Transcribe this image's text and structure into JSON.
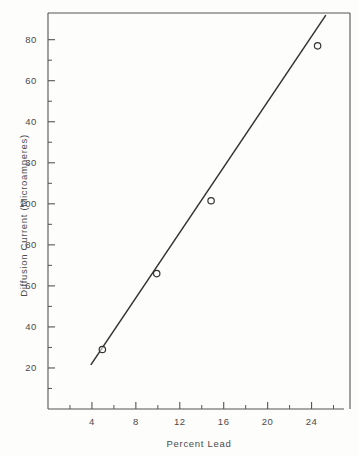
{
  "chart_data": {
    "type": "line",
    "title": "",
    "subtitle": "",
    "xlabel": "Percent  Lead",
    "ylabel": "Diffusion Current  (Microamperes)",
    "xlim": [
      0,
      27.5
    ],
    "ylim": [
      0,
      193
    ],
    "grid": false,
    "legend": null,
    "x_ticks": [
      {
        "value": 4,
        "label": "4"
      },
      {
        "value": 8,
        "label": "8"
      },
      {
        "value": 12,
        "label": "12"
      },
      {
        "value": 16,
        "label": "16"
      },
      {
        "value": 20,
        "label": "20"
      },
      {
        "value": 24,
        "label": "24"
      }
    ],
    "x_minor_ticks": [
      2,
      6,
      10,
      14,
      18,
      22,
      26
    ],
    "y_ticks": [
      {
        "value": 180,
        "label": "80"
      },
      {
        "value": 160,
        "label": "60"
      },
      {
        "value": 140,
        "label": "40"
      },
      {
        "value": 120,
        "label": "30"
      },
      {
        "value": 100,
        "label": "100"
      },
      {
        "value": 80,
        "label": "80"
      },
      {
        "value": 60,
        "label": "60"
      },
      {
        "value": 40,
        "label": "40"
      },
      {
        "value": 20,
        "label": "20"
      }
    ],
    "y_minor_ticks": [
      170,
      150,
      130,
      110,
      90,
      70,
      50,
      30,
      10
    ],
    "series": [
      {
        "name": "Calibration line",
        "type": "line",
        "color": "#333333",
        "x": [
          3.9,
          25.3
        ],
        "y": [
          21.5,
          192.0
        ]
      },
      {
        "name": "Measured points",
        "type": "scatter",
        "marker": "open-circle",
        "color": "#333333",
        "points": [
          {
            "x": 4.95,
            "y": 29.0
          },
          {
            "x": 9.9,
            "y": 66.0
          },
          {
            "x": 14.85,
            "y": 101.5
          },
          {
            "x": 24.55,
            "y": 177.0
          }
        ]
      }
    ]
  },
  "axes": {
    "x_title": "Percent  Lead",
    "y_title": "Diffusion Current  (Microamperes)"
  },
  "colors": {
    "background": "#fdfdfc",
    "axis": "#555555",
    "line": "#333333",
    "text": "#4a4a4a"
  }
}
